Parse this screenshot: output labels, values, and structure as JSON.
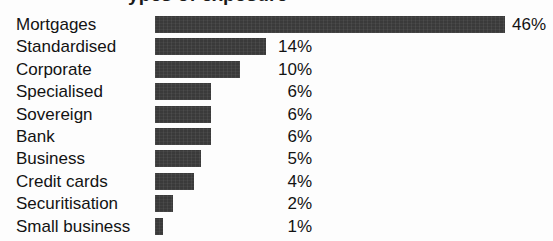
{
  "chart_data": {
    "type": "bar",
    "orientation": "horizontal",
    "title": "",
    "title_cropped_fragment": "ypes of exposure",
    "xlabel": "",
    "ylabel": "",
    "grid": false,
    "legend": false,
    "value_suffix": "%",
    "xlim": [
      0,
      46
    ],
    "bar_color": "#3a3a3a",
    "background_color": "#fdfdfd",
    "text_color": "#131313",
    "categories": [
      "Mortgages",
      "Standardised",
      "Corporate",
      "Specialised",
      "Sovereign",
      "Bank",
      "Business",
      "Credit cards",
      "Securitisation",
      "Small business"
    ],
    "values": [
      46,
      14,
      10,
      6,
      6,
      6,
      5,
      4,
      2,
      1
    ],
    "value_labels": [
      "46%",
      "14%",
      "10%",
      "6%",
      "6%",
      "6%",
      "5%",
      "4%",
      "2%",
      "1%"
    ],
    "bar_pixel_widths": [
      350,
      111,
      85,
      56,
      56,
      56,
      46,
      39,
      18,
      8
    ],
    "label_outside_bar": [
      true,
      false,
      false,
      false,
      false,
      false,
      false,
      false,
      false,
      false
    ],
    "rows": [
      {
        "label": "Mortgages",
        "value": 46,
        "value_label": "46%",
        "bar_width": 350,
        "outside": true
      },
      {
        "label": "Standardised",
        "value": 14,
        "value_label": "14%",
        "bar_width": 111,
        "outside": false
      },
      {
        "label": "Corporate",
        "value": 10,
        "value_label": "10%",
        "bar_width": 85,
        "outside": false
      },
      {
        "label": "Specialised",
        "value": 6,
        "value_label": "6%",
        "bar_width": 56,
        "outside": false
      },
      {
        "label": "Sovereign",
        "value": 6,
        "value_label": "6%",
        "bar_width": 56,
        "outside": false
      },
      {
        "label": "Bank",
        "value": 6,
        "value_label": "6%",
        "bar_width": 56,
        "outside": false
      },
      {
        "label": "Business",
        "value": 5,
        "value_label": "5%",
        "bar_width": 46,
        "outside": false
      },
      {
        "label": "Credit cards",
        "value": 4,
        "value_label": "4%",
        "bar_width": 39,
        "outside": false
      },
      {
        "label": "Securitisation",
        "value": 2,
        "value_label": "2%",
        "bar_width": 18,
        "outside": false
      },
      {
        "label": "Small business",
        "value": 1,
        "value_label": "1%",
        "bar_width": 8,
        "outside": false
      }
    ]
  }
}
